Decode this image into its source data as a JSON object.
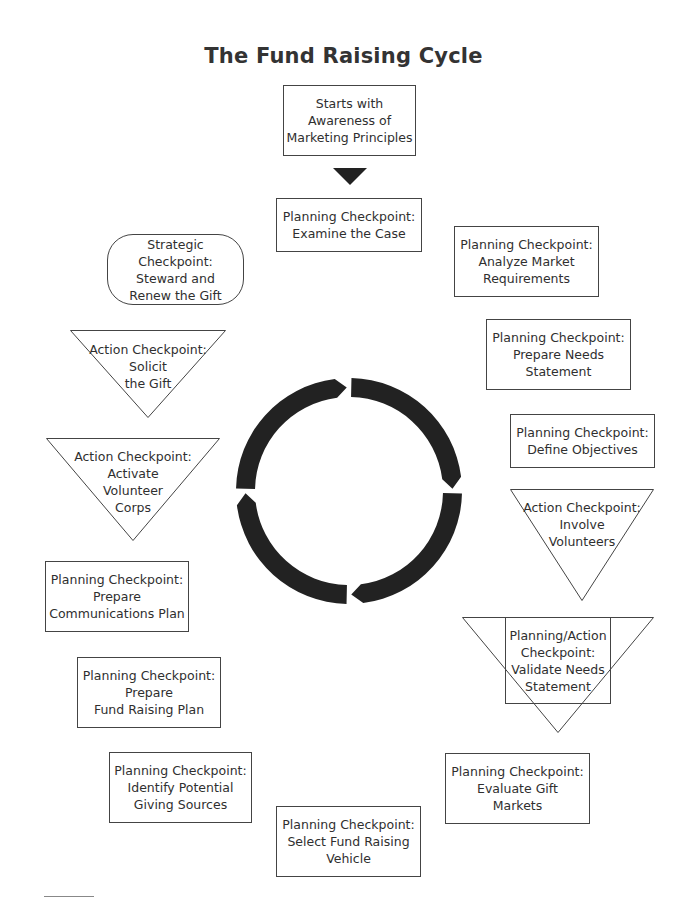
{
  "title": "The Fund Raising Cycle",
  "colors": {
    "ring": "#222222",
    "border": "#444444",
    "text": "#2f2f2f"
  },
  "start": {
    "text": "Starts with\nAwareness of\nMarketing Principles",
    "shape": "rectangle"
  },
  "start_arrow": {
    "icon": "down-triangle-arrow-icon"
  },
  "cycle": {
    "segments": 4,
    "direction": "clockwise",
    "icon": "circular-cycle-arrows-icon"
  },
  "nodes": [
    {
      "id": "examine-case",
      "type": "Planning",
      "shape": "rectangle",
      "text": "Planning Checkpoint:\nExamine the Case"
    },
    {
      "id": "analyze-market",
      "type": "Planning",
      "shape": "rectangle",
      "text": "Planning Checkpoint:\nAnalyze Market\nRequirements"
    },
    {
      "id": "prepare-needs",
      "type": "Planning",
      "shape": "rectangle",
      "text": "Planning Checkpoint:\nPrepare Needs\nStatement"
    },
    {
      "id": "define-objectives",
      "type": "Planning",
      "shape": "rectangle",
      "text": "Planning Checkpoint:\nDefine Objectives"
    },
    {
      "id": "involve-volunteers",
      "type": "Action",
      "shape": "inverted-triangle",
      "text": "Action Checkpoint:\nInvolve\nVolunteers"
    },
    {
      "id": "validate-needs",
      "type": "Planning/Action",
      "shape": "triangle-with-rectangle",
      "text": "Planning/Action\nCheckpoint:\nValidate Needs\nStatement"
    },
    {
      "id": "evaluate-gift-markets",
      "type": "Planning",
      "shape": "rectangle",
      "text": "Planning Checkpoint:\nEvaluate Gift\nMarkets"
    },
    {
      "id": "select-vehicle",
      "type": "Planning",
      "shape": "rectangle",
      "text": "Planning Checkpoint:\nSelect Fund Raising\nVehicle"
    },
    {
      "id": "identify-sources",
      "type": "Planning",
      "shape": "rectangle",
      "text": "Planning Checkpoint:\nIdentify Potential\nGiving Sources"
    },
    {
      "id": "fund-raising-plan",
      "type": "Planning",
      "shape": "rectangle",
      "text": "Planning Checkpoint:\nPrepare\nFund Raising Plan"
    },
    {
      "id": "communications-plan",
      "type": "Planning",
      "shape": "rectangle",
      "text": "Planning Checkpoint:\nPrepare\nCommunications Plan"
    },
    {
      "id": "activate-volunteers",
      "type": "Action",
      "shape": "inverted-triangle",
      "text": "Action Checkpoint:\nActivate\nVolunteer\nCorps"
    },
    {
      "id": "solicit-gift",
      "type": "Action",
      "shape": "inverted-triangle",
      "text": "Action Checkpoint:\nSolicit\nthe Gift"
    },
    {
      "id": "steward-renew",
      "type": "Strategic",
      "shape": "rounded-rectangle",
      "text": "Strategic Checkpoint:\nSteward and\nRenew the Gift"
    }
  ]
}
